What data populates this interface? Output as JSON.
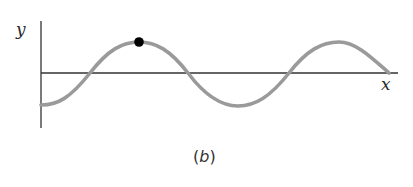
{
  "figure": {
    "caption": "(b)",
    "caption_paren_open": "(",
    "caption_letter": "b",
    "caption_paren_close": ")",
    "axes": {
      "x_label": "x",
      "y_label": "y"
    },
    "wave": {
      "description": "sinusoidal transverse wave",
      "stroke_color": "#9a9a9a",
      "marked_point": "crest",
      "marker_color": "#000000"
    },
    "colors": {
      "axis": "#333333",
      "wave": "#9a9a9a",
      "marker": "#000000",
      "background": "#ffffff"
    }
  }
}
